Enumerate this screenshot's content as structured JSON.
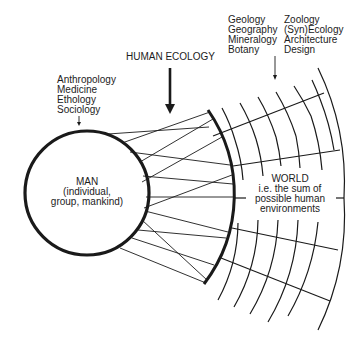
{
  "diagram": {
    "title_label": "HUMAN ECOLOGY",
    "man": {
      "lines": [
        "MAN",
        "(individual,",
        "group, mankind)"
      ]
    },
    "world": {
      "lines": [
        "WORLD",
        "i.e. the sum of",
        "possible human",
        "environments"
      ]
    },
    "human_sciences": [
      "Anthropology",
      "Medicine",
      "Ethology",
      "Sociology"
    ],
    "environment_sciences_col1": [
      "Geology",
      "Geography",
      "Mineralogy",
      "Botany"
    ],
    "environment_sciences_col2": [
      "Zoology",
      "(Syn)Ecology",
      "Architecture",
      "Design"
    ],
    "colors": {
      "ink": "#1a1a1a",
      "background": "#ffffff"
    }
  }
}
